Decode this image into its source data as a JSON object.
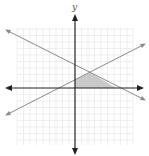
{
  "diagram": {
    "type": "coordinate-plane",
    "axis_labels": {
      "y": "y",
      "x": "x"
    },
    "grid": {
      "x_min": -9,
      "x_max": 9,
      "y_min": -9,
      "y_max": 9,
      "visible": true
    },
    "lines": [
      {
        "name": "descending-line",
        "slope": -0.5,
        "description": "line with negative slope crossing y-axis above origin"
      },
      {
        "name": "ascending-line",
        "slope": 0.5,
        "description": "line with positive slope crossing y-axis slightly above origin"
      }
    ],
    "shaded_region": "feasible region bounded by y-axis, x-axis, and the two lines",
    "colors": {
      "grid": "#e2e2e2",
      "axes": "#222222",
      "lines": "#8a8a8a",
      "shade": "#c8c8c8"
    }
  }
}
